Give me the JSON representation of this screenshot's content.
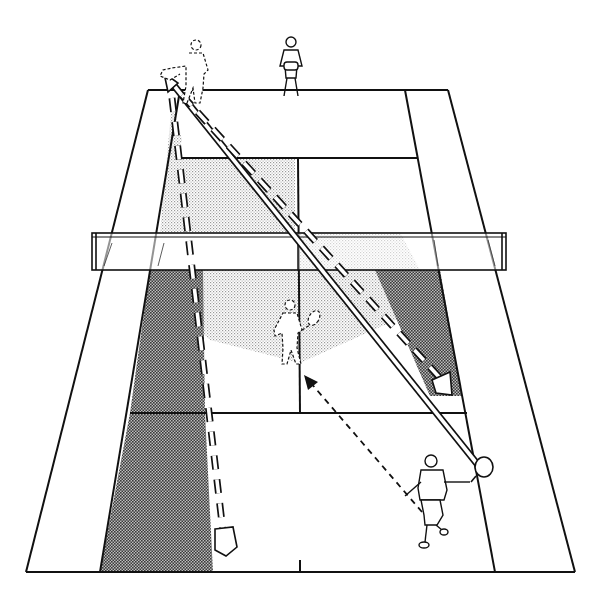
{
  "figure": {
    "title": "Doubles tennis tactic: lob over the net player and recovery positions"
  },
  "court": {
    "line_color": "#111111",
    "background": "#ffffff",
    "light_shade": "#d9d9d9",
    "dark_shade": "#8a8a8a"
  },
  "players": [
    {
      "id": "far-net-player",
      "label": "far player at baseline center",
      "style": "solid"
    },
    {
      "id": "far-ghost-player",
      "label": "far player previous position (dashed)",
      "style": "dashed"
    },
    {
      "id": "near-net-player-ghost",
      "label": "near net player previous position (dashed)",
      "style": "dashed"
    },
    {
      "id": "near-baseline-player",
      "label": "near player hitting from baseline",
      "style": "solid"
    }
  ],
  "arrows": [
    {
      "id": "lob-path",
      "label": "ball path (double line) from near player to far left corner",
      "style": "double-line"
    },
    {
      "id": "crosscourt-return",
      "label": "return path (large dashed) to near right shaded zone",
      "style": "large-dashed"
    },
    {
      "id": "down-line-return",
      "label": "return path (large dashed) down left side to near baseline",
      "style": "large-dashed"
    },
    {
      "id": "player-movement",
      "label": "near player movement toward net (small dashed)",
      "style": "small-dashed"
    }
  ]
}
